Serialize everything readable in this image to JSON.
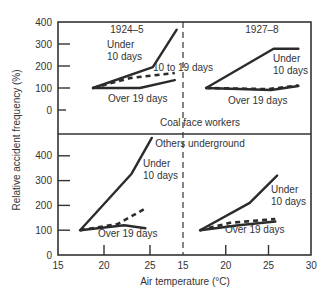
{
  "chart_data": {
    "type": "line",
    "title": "",
    "xlabel": "Air temperature (°C)",
    "ylabel": "Relative accident frequency (%)",
    "grid": false,
    "panels": [
      {
        "id": "coal-face-1924",
        "group": "Coal face workers",
        "period": "1924–5",
        "xlim": [
          15,
          30
        ],
        "ylim": [
          0,
          400
        ],
        "series": [
          {
            "name": "Under 10 days",
            "style": "solid",
            "points": [
              [
                18.8,
                100
              ],
              [
                25.3,
                195
              ],
              [
                27.9,
                365
              ]
            ]
          },
          {
            "name": "10 to 19 days",
            "style": "dashed",
            "points": [
              [
                18.8,
                100
              ],
              [
                22.8,
                145
              ],
              [
                27.7,
                168
              ]
            ]
          },
          {
            "name": "Over 19 days",
            "style": "solid",
            "points": [
              [
                18.8,
                100
              ],
              [
                23.9,
                100
              ],
              [
                27.7,
                136
              ]
            ]
          }
        ]
      },
      {
        "id": "coal-face-1927",
        "group": "Coal face workers",
        "period": "1927–8",
        "xlim": [
          15,
          30
        ],
        "ylim": [
          0,
          400
        ],
        "series": [
          {
            "name": "Under 10 days",
            "style": "solid",
            "points": [
              [
                17.7,
                100
              ],
              [
                25.6,
                278
              ],
              [
                28.5,
                278
              ]
            ]
          },
          {
            "name": "10 to 19 days",
            "style": "dashed",
            "points": [
              [
                17.7,
                100
              ],
              [
                25.0,
                95
              ],
              [
                28.5,
                112
              ]
            ]
          },
          {
            "name": "Over 19 days",
            "style": "solid",
            "points": [
              [
                17.7,
                100
              ],
              [
                25.3,
                91
              ],
              [
                28.5,
                109
              ]
            ]
          }
        ]
      },
      {
        "id": "others-1924",
        "group": "Others underground",
        "period": "1924–5",
        "xlim": [
          15,
          30
        ],
        "ylim": [
          0,
          500
        ],
        "series": [
          {
            "name": "Under 10 days",
            "style": "solid",
            "points": [
              [
                17.4,
                100
              ],
              [
                23.0,
                328
              ],
              [
                25.2,
                472
              ]
            ]
          },
          {
            "name": "10 to 19 days",
            "style": "dashed",
            "points": [
              [
                17.4,
                100
              ],
              [
                21.5,
                125
              ],
              [
                24.5,
                188
              ]
            ]
          },
          {
            "name": "Over 19 days",
            "style": "solid",
            "points": [
              [
                17.4,
                100
              ],
              [
                22.2,
                120
              ],
              [
                24.5,
                108
              ]
            ]
          }
        ]
      },
      {
        "id": "others-1927",
        "group": "Others underground",
        "period": "1927–8",
        "xlim": [
          15,
          30
        ],
        "ylim": [
          0,
          500
        ],
        "series": [
          {
            "name": "Under 10 days",
            "style": "solid",
            "points": [
              [
                17.0,
                100
              ],
              [
                22.8,
                210
              ],
              [
                26.0,
                320
              ]
            ]
          },
          {
            "name": "10 to 19 days",
            "style": "dashed",
            "points": [
              [
                17.0,
                100
              ],
              [
                20.5,
                130
              ],
              [
                25.8,
                145
              ]
            ]
          },
          {
            "name": "Over 19 days",
            "style": "solid",
            "points": [
              [
                17.0,
                100
              ],
              [
                21.5,
                120
              ],
              [
                25.8,
                135
              ]
            ]
          }
        ]
      }
    ],
    "x_ticks_left": [
      15,
      20,
      25
    ],
    "x_ticks_right": [
      15,
      20,
      25,
      30
    ],
    "y_ticks_top": [
      0,
      100,
      200,
      300,
      400
    ],
    "y_ticks_bottom": [
      0,
      100,
      200,
      300,
      400
    ]
  },
  "labels": {
    "period_1924": "1924–5",
    "period_1927": "1927–8",
    "coal_face": "Coal face workers",
    "others": "Others underground",
    "under_line1": "Under",
    "under_line2": "10 days",
    "ten_to_19": "10 to 19 days",
    "over_19": "Over 19 days",
    "xlabel": "Air temperature (°C)",
    "ylabel": "Relative accident frequency (%)"
  },
  "colors": {
    "line": "#2b2b2b",
    "axis": "#333333",
    "text": "#333333"
  }
}
